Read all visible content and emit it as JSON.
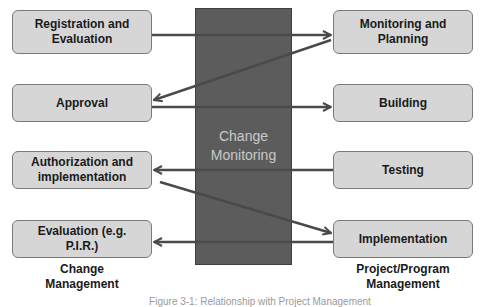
{
  "diagram": {
    "center": {
      "label_line1": "Change",
      "label_line2": "Monitoring"
    },
    "left_column": {
      "title_line1": "Change",
      "title_line2": "Management",
      "boxes": [
        {
          "line1": "Registration and",
          "line2": "Evaluation"
        },
        {
          "line1": "Approval",
          "line2": ""
        },
        {
          "line1": "Authorization and",
          "line2": "implementation"
        },
        {
          "line1": "Evaluation (e.g.",
          "line2": "P.I.R.)"
        }
      ]
    },
    "right_column": {
      "title_line1": "Project/Program",
      "title_line2": "Management",
      "boxes": [
        {
          "line1": "Monitoring and",
          "line2": "Planning"
        },
        {
          "line1": "Building",
          "line2": ""
        },
        {
          "line1": "Testing",
          "line2": ""
        },
        {
          "line1": "Implementation",
          "line2": ""
        }
      ]
    },
    "arrows": [
      {
        "from": "Registration and Evaluation",
        "to": "Monitoring and Planning"
      },
      {
        "from": "Monitoring and Planning",
        "to": "Approval"
      },
      {
        "from": "Approval",
        "to": "Building"
      },
      {
        "from": "Testing",
        "to": "Authorization and implementation"
      },
      {
        "from": "Authorization and implementation",
        "to": "Implementation"
      },
      {
        "from": "Implementation",
        "to": "Evaluation (e.g. P.I.R.)"
      }
    ],
    "caption": "Figure 3-1: Relationship with Project Management",
    "colors": {
      "center_block": "#5c5c5c",
      "box_fill": "#d6d6d6",
      "arrow": "#4a4a4a"
    }
  }
}
